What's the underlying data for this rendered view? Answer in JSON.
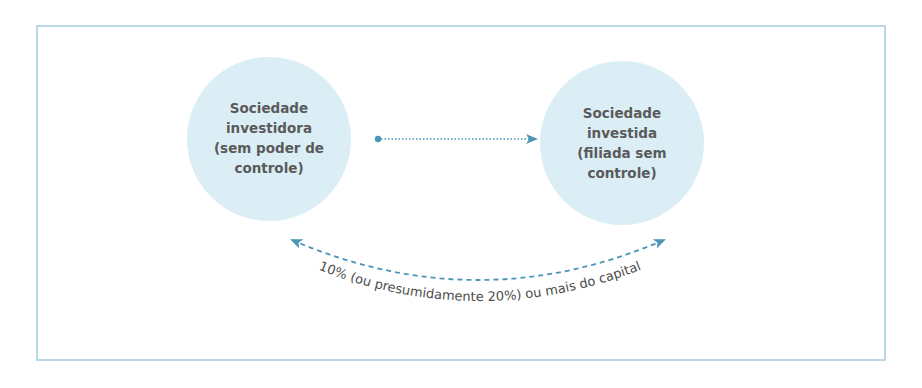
{
  "diagram": {
    "nodes": [
      {
        "id": "investidora",
        "lines": [
          "Sociedade",
          "investidora",
          "(sem poder de",
          "controle)"
        ]
      },
      {
        "id": "investida",
        "lines": [
          "Sociedade",
          "investida",
          "(filiada sem",
          "controle)"
        ]
      }
    ],
    "edges": [
      {
        "from": "investidora",
        "to": "investida",
        "style": "dotted",
        "label": ""
      },
      {
        "from": "investida",
        "to": "investidora",
        "style": "dashed-curved-bidirectional",
        "label": "10% (ou presumidamente 20%) ou mais do capital"
      }
    ],
    "curve_label": "10% (ou presumidamente 20%) ou mais do capital",
    "colors": {
      "circle_fill": "#dbeef6",
      "arrow": "#4a95b8",
      "frame": "#b9d9e6",
      "text": "#5a5a5a"
    }
  }
}
